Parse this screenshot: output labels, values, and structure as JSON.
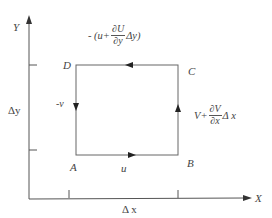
{
  "axes": {
    "y_label": "Y",
    "x_label": "X"
  },
  "corners": {
    "A": "A",
    "B": "B",
    "C": "C",
    "D": "D"
  },
  "velocities": {
    "bottom": "u",
    "left": "-v",
    "top": {
      "prefix": "- (u+",
      "numerator": "∂U",
      "denominator": "∂y",
      "suffix": "Δy)"
    },
    "right": {
      "prefix": "V+",
      "numerator": "∂V",
      "denominator": "∂x",
      "suffix": "Δ x"
    }
  },
  "dimensions": {
    "dy": "Δy",
    "dx": "Δ x"
  },
  "colors": {
    "line": "#555555",
    "text": "#444444"
  }
}
